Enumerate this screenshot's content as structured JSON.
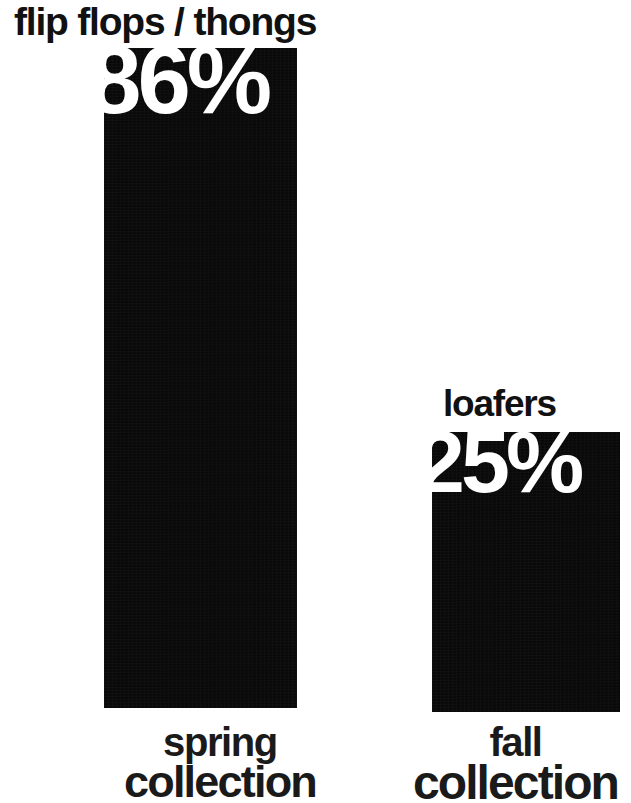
{
  "chart_data": {
    "type": "bar",
    "title": "",
    "xlabel": "",
    "ylabel": "",
    "ylim": [
      0,
      100
    ],
    "unit": "%",
    "grid": false,
    "legend": "none",
    "orientation": "vertical",
    "bar_color": "#090909",
    "value_color": "#ffffff",
    "background": "#ffffff",
    "categories": [
      "spring collection",
      "fall collection"
    ],
    "values": [
      86,
      25
    ],
    "value_labels": [
      "86%",
      "25%"
    ],
    "series": [
      {
        "name": "share of collection",
        "values": [
          86,
          25
        ]
      }
    ],
    "points": [
      {
        "category": "spring collection",
        "item": "flip flops / thongs",
        "value": 86,
        "value_label": "86%"
      },
      {
        "category": "fall collection",
        "item": "loafers",
        "value": 25,
        "value_label": "25%"
      }
    ]
  },
  "bars": {
    "spring": {
      "item_title": "flip flops / thongs",
      "value_label": "86%",
      "axis_line1": "spring",
      "axis_line2": "collection"
    },
    "fall": {
      "item_title": "loafers",
      "value_label": "25%",
      "axis_line1": "fall",
      "axis_line2": "collection"
    }
  }
}
